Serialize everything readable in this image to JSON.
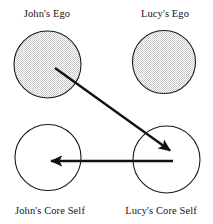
{
  "figure": {
    "type": "concept-diagram",
    "background_color": "#ffffff",
    "stroke_color": "#1a1a1a",
    "shaded_fill_color": "#d9d9d9",
    "unshaded_fill_color": "#ffffff"
  },
  "nodes": [
    {
      "id": "johns-ego",
      "label": "John's Ego",
      "shape": "circle",
      "shaded": true,
      "cx": 47.5,
      "cy": 64.5,
      "r": 33.5
    },
    {
      "id": "lucys-ego",
      "label": "Lucy's Ego",
      "shape": "circle",
      "shaded": true,
      "cx": 164,
      "cy": 62,
      "r": 31.5
    },
    {
      "id": "johns-core-self",
      "label": "John's Core Self",
      "shape": "circle",
      "shaded": false,
      "cx": 48,
      "cy": 157.5,
      "r": 33
    },
    {
      "id": "lucys-core-self",
      "label": "Lucy's Core Self",
      "shape": "circle",
      "shaded": false,
      "cx": 166.5,
      "cy": 159.5,
      "r": 33.5
    }
  ],
  "arrows": [
    {
      "id": "arrow-johns-ego-to-lucys-core-self",
      "from": "johns-ego",
      "to": "lucys-core-self",
      "direction": "diagonal-down-right",
      "x1": 55,
      "y1": 68,
      "x2": 172,
      "y2": 152
    },
    {
      "id": "arrow-lucys-core-self-to-johns-core-self",
      "from": "lucys-core-self",
      "to": "johns-core-self",
      "direction": "horizontal-left",
      "x1": 173,
      "y1": 161,
      "x2": 48,
      "y2": 161
    }
  ]
}
